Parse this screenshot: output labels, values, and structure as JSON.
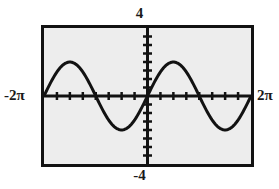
{
  "figure": {
    "kind": "graphing-calculator-plot",
    "background_color": "#ffffff",
    "plot_fill_color": "#ededed",
    "ink_color": "#121212"
  },
  "labels": {
    "y_max": "4",
    "y_min": "-4",
    "x_min": "-2π",
    "x_max": "2π"
  },
  "chart_data": {
    "type": "line",
    "title": "",
    "subtitle": "",
    "xlabel": "",
    "ylabel": "",
    "grid": false,
    "legend": [],
    "legend_position": "none",
    "xlim": [
      -6.283185307,
      6.283185307
    ],
    "ylim": [
      -4,
      4
    ],
    "xlim_labels": [
      "-2π",
      "2π"
    ],
    "ylim_labels": [
      "-4",
      "4"
    ],
    "x_tick_labels": [],
    "y_tick_labels": [],
    "x_tick_values": [
      -5.497787,
      -4.712389,
      -3.926991,
      -3.141593,
      -2.356194,
      -1.570796,
      -0.785398,
      0.785398,
      1.570796,
      2.356194,
      3.141593,
      3.926991,
      4.712389,
      5.497787
    ],
    "y_tick_values": [
      -3.5,
      -3.0,
      -2.5,
      -2.0,
      -1.5,
      -1.0,
      -0.5,
      0.5,
      1.0,
      1.5,
      2.0,
      2.5,
      3.0,
      3.5
    ],
    "x_axis_visible": true,
    "y_axis_visible": true,
    "annotations": [],
    "series": [
      {
        "name": "y = 2 sin(x)",
        "amplitude": 2,
        "period": 6.283185307,
        "x": [
          -6.283185,
          -6.021386,
          -5.759587,
          -5.497787,
          -5.235988,
          -4.974188,
          -4.712389,
          -4.45059,
          -4.18879,
          -3.926991,
          -3.665191,
          -3.403392,
          -3.141593,
          -2.879793,
          -2.617994,
          -2.356194,
          -2.094395,
          -1.832596,
          -1.570796,
          -1.308997,
          -1.047198,
          -0.785398,
          -0.523599,
          -0.261799,
          0,
          0.261799,
          0.523599,
          0.785398,
          1.047198,
          1.308997,
          1.570796,
          1.832596,
          2.094395,
          2.356194,
          2.617994,
          2.879793,
          3.141593,
          3.403392,
          3.665191,
          3.926991,
          4.18879,
          4.45059,
          4.712389,
          4.974188,
          5.235988,
          5.497787,
          5.759587,
          6.021386,
          6.283185
        ],
        "y": [
          0,
          -0.518,
          -1.0,
          -1.414,
          -1.732,
          -1.932,
          -2.0,
          -1.932,
          -1.732,
          -1.414,
          -1.0,
          -0.518,
          0,
          0.518,
          1.0,
          1.414,
          1.732,
          1.932,
          2.0,
          1.932,
          1.732,
          1.414,
          1.0,
          0.518,
          0,
          -0.518,
          -1.0,
          -1.414,
          -1.732,
          -1.932,
          -2.0,
          -1.932,
          -1.732,
          -1.414,
          -1.0,
          -0.518,
          0,
          0.518,
          1.0,
          1.414,
          1.732,
          1.932,
          2.0,
          1.932,
          1.732,
          1.414,
          1.0,
          0.518,
          0
        ]
      }
    ],
    "displayed_curve": {
      "description": "single sine cycle across the window: zero at -2π, minimum near -π, zero at 0, maximum near π, zero at 2π",
      "x": [
        -6.283185,
        -5.890486,
        -5.497787,
        -5.105088,
        -4.712389,
        -4.31969,
        -3.926991,
        -3.534292,
        -3.141593,
        -2.748894,
        -2.356194,
        -1.963495,
        -1.570796,
        -1.178097,
        -0.785398,
        -0.392699,
        0,
        0.392699,
        0.785398,
        1.178097,
        1.570796,
        1.963495,
        2.356194,
        2.748894,
        3.141593,
        3.534292,
        3.926991,
        4.31969,
        4.712389,
        5.105088,
        5.497787,
        5.890486,
        6.283185
      ],
      "y": [
        0,
        -0.765,
        -1.414,
        -1.848,
        -2.0,
        -1.848,
        -1.414,
        -0.765,
        0,
        0.765,
        1.414,
        1.848,
        2.0,
        1.848,
        1.414,
        0.765,
        0,
        -0.765,
        -1.414,
        -1.848,
        -2.0,
        -1.848,
        -1.414,
        -0.765,
        0,
        0.765,
        1.414,
        1.848,
        2.0,
        1.848,
        1.414,
        0.765,
        0
      ]
    }
  }
}
